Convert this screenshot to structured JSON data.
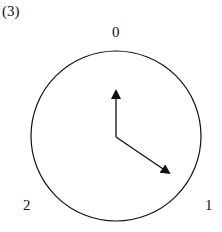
{
  "figure_label": "(3)",
  "dial": {
    "labels": {
      "top": "0",
      "bottom_right": "1",
      "bottom_left": "2"
    },
    "circle": {
      "cx": 116,
      "cy": 136,
      "r": 85
    },
    "arrows": [
      {
        "name": "vertical-arrow",
        "from": [
          116,
          137
        ],
        "to": [
          116,
          89
        ]
      },
      {
        "name": "diagonal-arrow",
        "from": [
          116,
          137
        ],
        "to": [
          171,
          174
        ]
      }
    ]
  },
  "colors": {
    "stroke": "#111111",
    "background": "#ffffff"
  }
}
